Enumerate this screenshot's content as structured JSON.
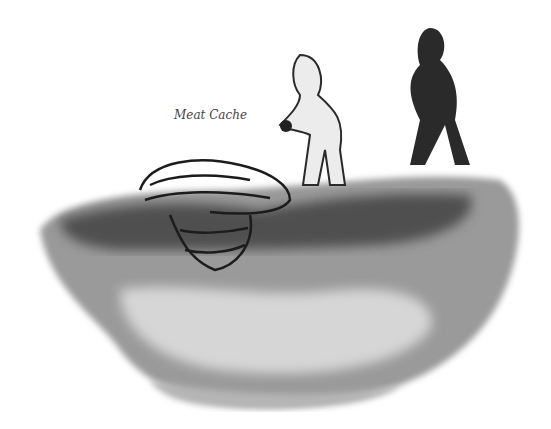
{
  "illustration": {
    "label": "Meat Cache",
    "colors": {
      "ink": "#222222",
      "wash_dark": "#5a5a5a",
      "wash_light": "#bdbdbd",
      "frost": "#e8e8e8"
    }
  }
}
